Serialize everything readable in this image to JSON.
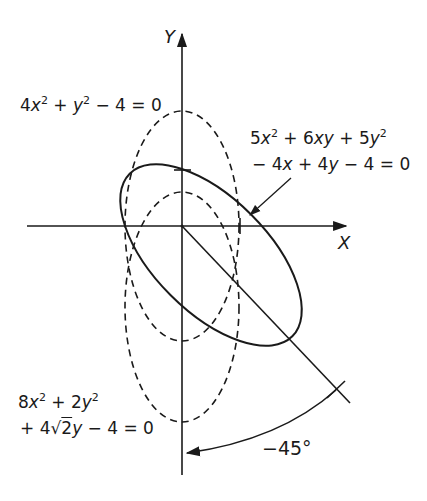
{
  "diagram": {
    "type": "conic-rotation",
    "axes": {
      "x_label": "X",
      "y_label": "Y",
      "origin_px": [
        182,
        226
      ],
      "unit_px": 57.5
    },
    "curves": [
      {
        "id": "ellipse-original",
        "style": "solid",
        "equation_line1": "5x² + 6xy + 5y²",
        "equation_line2": "− 4x + 4y − 4 = 0",
        "center": [
          0.5,
          -0.5
        ],
        "rotation_deg": -45,
        "semi_axes": [
          2,
          1
        ]
      },
      {
        "id": "ellipse-rotated-origin",
        "style": "dashed",
        "equation": "4x² + y² − 4 = 0",
        "center": [
          0,
          0
        ],
        "semi_axes": [
          1,
          2
        ]
      },
      {
        "id": "ellipse-rotated-shifted",
        "style": "dashed",
        "equation_line1": "8x² + 2y²",
        "equation_line2": "+ 4√2 y − 4 = 0",
        "center": [
          0,
          -1.414
        ],
        "semi_axes": [
          1,
          2
        ]
      }
    ],
    "rotation": {
      "angle_label": "−45°"
    }
  },
  "labels": {
    "eq_dashed_top": {
      "a": "4",
      "b": "x",
      "c": "2",
      "d": " + ",
      "e": "y",
      "f": "2",
      "g": " − 4 = 0"
    },
    "eq_solid_1": {
      "a": "5",
      "b": "x",
      "c": "2",
      "d": " + 6",
      "e": "xy",
      "f": " + 5",
      "g": "y",
      "h": "2"
    },
    "eq_solid_2": {
      "a": "− 4",
      "b": "x",
      "c": " + 4",
      "d": "y",
      "e": " − 4 = 0"
    },
    "eq_shifted_1": {
      "a": "8",
      "b": "x",
      "c": "2",
      "d": " + 2",
      "e": "y",
      "f": "2"
    },
    "eq_shifted_2": {
      "a": "+ 4",
      "b": "√",
      "c": "2",
      "d": "y",
      "e": " − 4 = 0"
    },
    "angle": "−45°",
    "x_axis": "X",
    "y_axis": "Y"
  }
}
